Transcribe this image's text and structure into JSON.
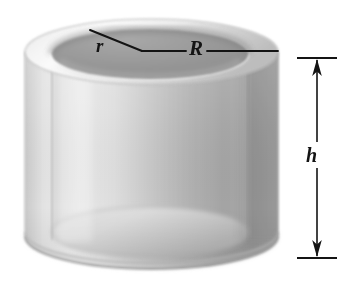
{
  "figure": {
    "kind": "technical-illustration",
    "background_color": "#ffffff",
    "canvas": {
      "width": 344,
      "height": 292
    }
  },
  "labels": {
    "inner_radius": "r",
    "outer_radius": "R",
    "height": "h"
  },
  "geometry": {
    "outer_top_ellipse": {
      "cx": 151.5,
      "cy": 52,
      "rx": 126.5,
      "ry": 33
    },
    "inner_top_ellipse": {
      "cx": 150,
      "cy": 54,
      "rx": 98,
      "ry": 25
    },
    "outer_bottom_ellipse": {
      "cx": 151.5,
      "cy": 236,
      "rx": 126.5,
      "ry": 33
    },
    "inner_bottom_ellipse": {
      "cx": 150,
      "cy": 232,
      "rx": 98,
      "ry": 25
    },
    "body_top_y": 52,
    "body_bottom_y": 236,
    "outer_left_x": 25,
    "outer_right_x": 278,
    "inner_left_x": 52,
    "inner_right_x": 248
  },
  "leader_lines": {
    "radius_vertex": {
      "x": 142,
      "y": 51
    },
    "inner_radius_end": {
      "x": 90,
      "y": 30
    },
    "outer_radius_end": {
      "x": 278,
      "y": 51
    }
  },
  "height_dimension": {
    "axis_x": 317,
    "top_tick_y": 58,
    "bottom_tick_y": 258,
    "tick_half_width": 20,
    "arrowheads": "double",
    "label": "h"
  },
  "colors": {
    "line": "#141414",
    "rim_highlight": "#f2f2f2",
    "rim_shadow": "#b9b9b9",
    "hole_interior_dark": "#909090",
    "hole_interior_light": "#c6c6c6",
    "wall_light": "#e9e9e9",
    "wall_mid": "#cfcfcf",
    "wall_dark": "#a0a0a0",
    "wall_darkest": "#8c8c8c",
    "floor_light": "#dcdcdc",
    "floor_shadow": "#b0b0b0"
  }
}
